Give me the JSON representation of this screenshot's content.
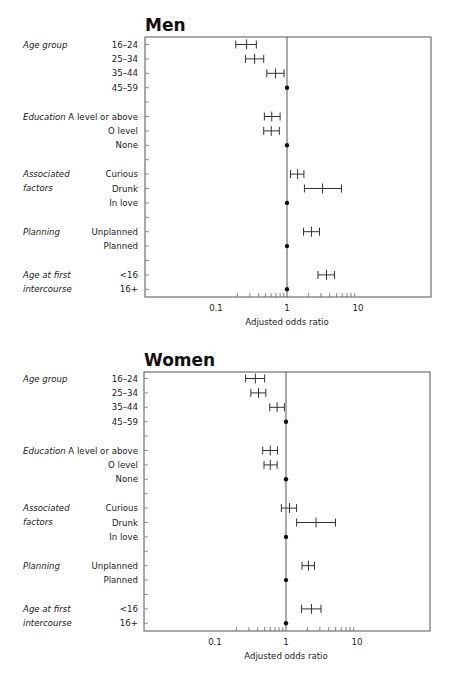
{
  "figure": {
    "x_axis": {
      "label": "Adjusted odds ratio",
      "scale": "log",
      "range": [
        0.1,
        10
      ],
      "tick_labels": [
        "0.1",
        "1",
        "10"
      ]
    }
  },
  "chart_data": [
    {
      "type": "forest",
      "title": "Men",
      "xlabel": "Adjusted odds ratio",
      "xscale": "log",
      "xlim": [
        0.1,
        10
      ],
      "xticks": [
        "0.1",
        "1",
        "10"
      ],
      "reference_line": 1,
      "groups": [
        {
          "name": "Age group",
          "rows": [
            {
              "label": "16–24",
              "or": 0.27,
              "ci": [
                0.19,
                0.37
              ]
            },
            {
              "label": "25–34",
              "or": 0.35,
              "ci": [
                0.26,
                0.47
              ]
            },
            {
              "label": "35–44",
              "or": 0.69,
              "ci": [
                0.52,
                0.91
              ]
            },
            {
              "label": "45–59",
              "or": 1,
              "reference": true
            }
          ]
        },
        {
          "name": "Education",
          "rows": [
            {
              "label": "A level or above",
              "or": 0.61,
              "ci": [
                0.48,
                0.8
              ]
            },
            {
              "label": "O level",
              "or": 0.6,
              "ci": [
                0.47,
                0.78
              ]
            },
            {
              "label": "None",
              "or": 1,
              "reference": true
            }
          ]
        },
        {
          "name": "Associated factors",
          "rows": [
            {
              "label": "Curious",
              "or": 1.41,
              "ci": [
                1.12,
                1.73
              ]
            },
            {
              "label": "Drunk",
              "or": 3.17,
              "ci": [
                1.76,
                5.86
              ]
            },
            {
              "label": "In love",
              "or": 1,
              "reference": true
            }
          ]
        },
        {
          "name": "Planning",
          "rows": [
            {
              "label": "Unplanned",
              "or": 2.21,
              "ci": [
                1.71,
                2.87
              ]
            },
            {
              "label": "Planned",
              "or": 1,
              "reference": true
            }
          ]
        },
        {
          "name": "Age at first intercourse",
          "rows": [
            {
              "label": "<16",
              "or": 3.6,
              "ci": [
                2.73,
                4.67
              ]
            },
            {
              "label": "16+",
              "or": 1,
              "reference": true
            }
          ]
        }
      ]
    },
    {
      "type": "forest",
      "title": "Women",
      "xlabel": "Adjusted odds ratio",
      "xscale": "log",
      "xlim": [
        0.1,
        10
      ],
      "xticks": [
        "0.1",
        "1",
        "10"
      ],
      "reference_line": 1,
      "groups": [
        {
          "name": "Age group",
          "rows": [
            {
              "label": "16–24",
              "or": 0.37,
              "ci": [
                0.27,
                0.5
              ]
            },
            {
              "label": "25–34",
              "or": 0.41,
              "ci": [
                0.32,
                0.52
              ]
            },
            {
              "label": "35–44",
              "or": 0.75,
              "ci": [
                0.59,
                0.95
              ]
            },
            {
              "label": "45–59",
              "or": 1,
              "reference": true
            }
          ]
        },
        {
          "name": "Education",
          "rows": [
            {
              "label": "A level or above",
              "or": 0.6,
              "ci": [
                0.47,
                0.76
              ]
            },
            {
              "label": "O level",
              "or": 0.6,
              "ci": [
                0.49,
                0.75
              ]
            },
            {
              "label": "None",
              "or": 1,
              "reference": true
            }
          ]
        },
        {
          "name": "Associated factors",
          "rows": [
            {
              "label": "Curious",
              "or": 1.12,
              "ci": [
                0.86,
                1.41
              ]
            },
            {
              "label": "Drunk",
              "or": 2.65,
              "ci": [
                1.41,
                4.98
              ]
            },
            {
              "label": "In love",
              "or": 1,
              "reference": true
            }
          ]
        },
        {
          "name": "Planning",
          "rows": [
            {
              "label": "Unplanned",
              "or": 2.07,
              "ci": [
                1.68,
                2.52
              ]
            },
            {
              "label": "Planned",
              "or": 1,
              "reference": true
            }
          ]
        },
        {
          "name": "Age at first intercourse",
          "rows": [
            {
              "label": "<16",
              "or": 2.29,
              "ci": [
                1.65,
                3.11
              ]
            },
            {
              "label": "16+",
              "or": 1,
              "reference": true
            }
          ]
        }
      ]
    }
  ],
  "layout_groups": {
    "group_label_lines": {
      "Age group": [
        "Age group"
      ],
      "Education": [
        "Education"
      ],
      "Associated factors": [
        "Associated",
        "factors"
      ],
      "Planning": [
        "Planning"
      ],
      "Age at first intercourse": [
        "Age at first",
        "intercourse"
      ]
    }
  }
}
